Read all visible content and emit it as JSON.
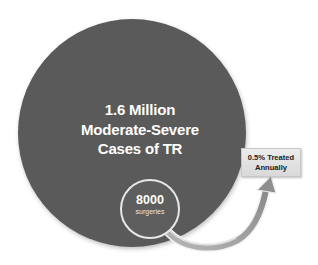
{
  "main_circle": {
    "line1": "1.6 Million",
    "line2": "Moderate-Severe",
    "line3": "Cases of TR",
    "color": "#5a5a5a"
  },
  "inner_circle": {
    "number": "8000",
    "label": "surgeries",
    "color": "#5e5e5e",
    "border_color": "#e8e8e8"
  },
  "callout_box": {
    "line1": "0.5% Treated",
    "line2": "Annually"
  },
  "arrow": {
    "color": "#8a8a8a",
    "highlight": "#d9d9d9"
  }
}
